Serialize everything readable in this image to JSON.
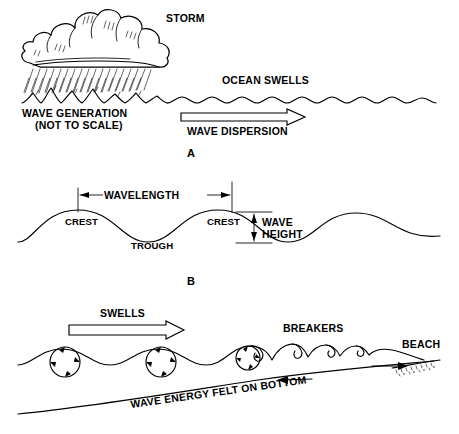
{
  "figure": {
    "background": "#ffffff",
    "ink_color": "#000000",
    "style": "monochrome line art"
  },
  "panels": [
    {
      "letter": "A",
      "name": "wave-generation-and-dispersion",
      "labels": {
        "storm": "STORM",
        "ocean_swells": "OCEAN SWELLS",
        "wave_generation": "WAVE GENERATION",
        "not_to_scale": "(NOT TO SCALE)",
        "wave_dispersion": "WAVE DISPERSION"
      },
      "arrows": [
        {
          "name": "wave-dispersion-arrow",
          "direction": "right",
          "style": "hollow-outline"
        }
      ]
    },
    {
      "letter": "B",
      "name": "wave-anatomy",
      "labels": {
        "wavelength": "WAVELENGTH",
        "crest_left": "CREST",
        "crest_right": "CREST",
        "trough": "TROUGH",
        "wave_height_line1": "WAVE",
        "wave_height_line2": "HEIGHT"
      },
      "dimensions": [
        {
          "name": "wavelength-dimension",
          "orientation": "horizontal",
          "arrowheads": "both"
        },
        {
          "name": "wave-height-dimension",
          "orientation": "vertical",
          "arrowheads": "both"
        }
      ]
    },
    {
      "letter": "C",
      "name": "shoaling-and-breaking",
      "labels": {
        "swells": "SWELLS",
        "breakers": "BREAKERS",
        "beach": "BEACH",
        "bottom": "WAVE ENERGY FELT ON BOTTOM"
      },
      "arrows": [
        {
          "name": "swells-arrow",
          "direction": "right",
          "style": "hollow-outline"
        },
        {
          "name": "backwash-arrow",
          "direction": "left",
          "style": "line"
        },
        {
          "name": "swash-arrow",
          "direction": "right",
          "style": "line"
        }
      ],
      "orbital_circles": 3
    }
  ]
}
